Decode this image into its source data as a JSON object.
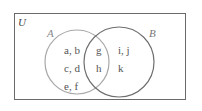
{
  "diagram": {
    "type": "venn",
    "universe_label": "U",
    "sets": [
      {
        "name": "A",
        "label": "A",
        "color": "#a8a8a8"
      },
      {
        "name": "B",
        "label": "B",
        "color": "#6e6e6e"
      }
    ],
    "regions": {
      "a_only": [
        "a, b",
        "c, d",
        "e, f"
      ],
      "intersection": [
        "g",
        "h"
      ],
      "b_only": [
        "i, j",
        "k"
      ]
    }
  }
}
